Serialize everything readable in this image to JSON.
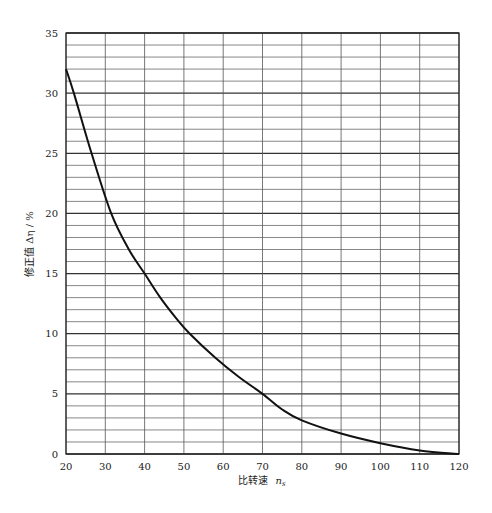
{
  "chart_data": {
    "type": "line",
    "title": "",
    "xlabel": "比转速 n_s",
    "xlabel_main": "比转速",
    "xlabel_var": "n",
    "xlabel_sub": "s",
    "ylabel": "修正值 Δη / %",
    "xlim": [
      20,
      120
    ],
    "ylim": [
      0,
      35
    ],
    "x_ticks": [
      20,
      30,
      40,
      50,
      60,
      70,
      80,
      90,
      100,
      110,
      120
    ],
    "y_ticks": [
      0,
      5,
      10,
      15,
      20,
      25,
      30,
      35
    ],
    "grid": {
      "x_step": 10,
      "y_minor_step": 1,
      "y_major_step": 5
    },
    "legend": null,
    "series": [
      {
        "name": "修正值 Δη",
        "x": [
          20,
          22,
          26.5,
          31.5,
          36,
          40,
          44,
          48,
          51.5,
          58,
          64,
          70,
          75,
          80,
          90,
          100,
          110,
          120
        ],
        "values": [
          32,
          30,
          25,
          20,
          17,
          15,
          13,
          11.3,
          10,
          8,
          6.4,
          5,
          3.7,
          2.8,
          1.7,
          0.9,
          0.3,
          0
        ]
      }
    ]
  },
  "colors": {
    "grid": "#555555",
    "major_grid": "#333333",
    "curve": "#111111",
    "axis": "#222222"
  }
}
